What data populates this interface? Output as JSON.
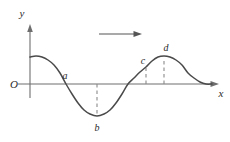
{
  "figure": {
    "title": "",
    "axes": {
      "y_label": "y",
      "x_label": "x",
      "origin_label": "O"
    },
    "direction_arrow": {
      "name": "wave-propagation-arrow",
      "direction": "right"
    },
    "points": [
      {
        "id": "a",
        "label": "a",
        "x": 66,
        "y": 84,
        "has_dashed_line": false,
        "description": "wave crosses x-axis descending"
      },
      {
        "id": "b",
        "label": "b",
        "x": 97,
        "y": 116,
        "has_dashed_line": true,
        "description": "trough minimum"
      },
      {
        "id": "c",
        "label": "c",
        "x": 146,
        "y": 72,
        "has_dashed_line": true,
        "description": "point on rising edge"
      },
      {
        "id": "d",
        "label": "d",
        "x": 164,
        "y": 56,
        "has_dashed_line": true,
        "description": "crest maximum"
      }
    ],
    "colors": {
      "curve": "#4a4a4a",
      "axis": "#6e6e6e",
      "dashed": "#8a8a8a",
      "text": "#2b2b2b",
      "background": "#ffffff"
    }
  },
  "chart_data": {
    "type": "line",
    "title": "",
    "xlabel": "x",
    "ylabel": "y",
    "grid": false,
    "legend": null,
    "annotations": [
      "a",
      "b",
      "c",
      "d",
      "O",
      "propagation arrow pointing right"
    ],
    "series": [
      {
        "name": "wave",
        "x": [
          30,
          36,
          42,
          48,
          54,
          60,
          66,
          72,
          78,
          84,
          90,
          97,
          104,
          110,
          116,
          122,
          128,
          134,
          140,
          146,
          152,
          158,
          164,
          170,
          176,
          182,
          188,
          194,
          200,
          206,
          212
        ],
        "y": [
          57,
          56,
          57,
          60,
          65,
          73,
          84,
          94,
          103,
          110,
          114,
          116,
          114,
          110,
          103,
          94,
          84,
          78,
          72,
          67,
          61,
          57,
          56,
          57,
          60,
          65,
          73,
          78,
          82,
          84,
          84
        ]
      }
    ]
  }
}
